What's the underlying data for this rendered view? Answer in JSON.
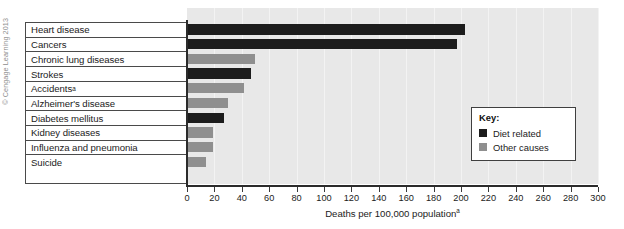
{
  "credit": "© Cengage Learning 2013",
  "chart_data": {
    "type": "bar",
    "orientation": "horizontal",
    "title": "",
    "xlabel": "Deaths per 100,000 population",
    "xlabel_superscript": "a",
    "ylabel": "",
    "xlim": [
      0,
      300
    ],
    "xticks": [
      0,
      20,
      40,
      60,
      80,
      100,
      120,
      140,
      160,
      180,
      200,
      220,
      240,
      260,
      280,
      300
    ],
    "grid": true,
    "legend_position": "inside-right",
    "categories": [
      "Heart disease",
      "Cancers",
      "Chronic lung diseases",
      "Strokes",
      "Accidents",
      "Alzheimer's disease",
      "Diabetes mellitus",
      "Kidney diseases",
      "Influenza and pneumonia",
      "Suicide"
    ],
    "values": [
      202,
      196,
      49,
      46,
      41,
      29,
      26,
      18,
      18,
      13
    ],
    "groups": [
      "diet",
      "diet",
      "other",
      "diet",
      "other",
      "other",
      "diet",
      "other",
      "other",
      "other"
    ],
    "bars": [
      {
        "label": "Heart disease",
        "value": 202,
        "group": "diet",
        "superscript": ""
      },
      {
        "label": "Cancers",
        "value": 196,
        "group": "diet",
        "superscript": ""
      },
      {
        "label": "Chronic lung diseases",
        "value": 49,
        "group": "other",
        "superscript": ""
      },
      {
        "label": "Strokes",
        "value": 46,
        "group": "diet",
        "superscript": ""
      },
      {
        "label": "Accidents",
        "value": 41,
        "group": "other",
        "superscript": "a"
      },
      {
        "label": "Alzheimer's disease",
        "value": 29,
        "group": "other",
        "superscript": ""
      },
      {
        "label": "Diabetes mellitus",
        "value": 26,
        "group": "diet",
        "superscript": ""
      },
      {
        "label": "Kidney diseases",
        "value": 18,
        "group": "other",
        "superscript": ""
      },
      {
        "label": "Influenza and pneumonia",
        "value": 18,
        "group": "other",
        "superscript": ""
      },
      {
        "label": "Suicide",
        "value": 13,
        "group": "other",
        "superscript": ""
      }
    ],
    "series": [
      {
        "name": "Diet related",
        "color": "#1c1c1c"
      },
      {
        "name": "Other causes",
        "color": "#8f8f8f"
      }
    ],
    "legend": {
      "title": "Key:",
      "entries": [
        {
          "label": "Diet related",
          "color": "#1c1c1c",
          "group": "diet"
        },
        {
          "label": "Other causes",
          "color": "#8f8f8f",
          "group": "other"
        }
      ]
    },
    "colors": {
      "diet_related": "#1c1c1c",
      "other_causes": "#8f8f8f",
      "plot_background": "#e8e8e8",
      "axis": "#2b2b2b",
      "text": "#1b1b1b"
    }
  }
}
